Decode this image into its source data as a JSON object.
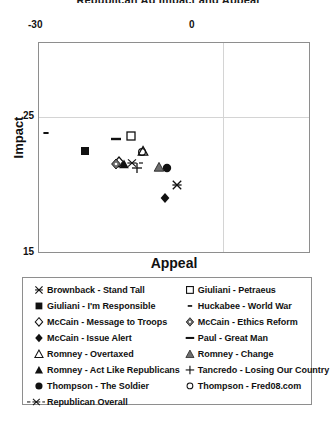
{
  "chart": {
    "title": "Republican Ad Impact and Appeal",
    "x_axis_title": "Appeal",
    "y_axis_title": "Impact"
  },
  "chart_data": {
    "type": "scatter",
    "title": "Republican Ad Impact and Appeal",
    "xlabel": "Appeal",
    "ylabel": "Impact",
    "xlim": [
      -30,
      14
    ],
    "ylim": [
      15,
      30.5
    ],
    "xticks": [
      "-30",
      "0"
    ],
    "xtick_values": [
      -30,
      0
    ],
    "yticks": [
      "25",
      "15"
    ],
    "ytick_values": [
      25,
      15
    ],
    "grid": true,
    "grid_lines": {
      "vertical_at": [
        0
      ],
      "horizontal_at": [
        25
      ]
    },
    "legend_position": "below-plot",
    "points": [
      {
        "label": "Brownback - Stand Tall",
        "marker": "x-thin",
        "x": -7.5,
        "y": 20.0
      },
      {
        "label": "Giuliani - I'm Responsible",
        "marker": "filled-square",
        "x": -22.5,
        "y": 22.5
      },
      {
        "label": "McCain - Message to Troops",
        "marker": "open-diamond",
        "x": -17.0,
        "y": 21.7
      },
      {
        "label": "McCain - Issue Alert",
        "marker": "filled-diamond",
        "x": -9.5,
        "y": 19.0
      },
      {
        "label": "Romney - Overtaxed",
        "marker": "open-triangle",
        "x": -13.0,
        "y": 22.5
      },
      {
        "label": "Romney - Act Like Republicans",
        "marker": "filled-triangle",
        "x": -16.2,
        "y": 21.5
      },
      {
        "label": "Thompson - The Soldier",
        "marker": "filled-circle",
        "x": -9.2,
        "y": 21.2
      },
      {
        "label": "Republican Overall",
        "marker": "dash-x-dash",
        "x": -14.8,
        "y": 21.6
      },
      {
        "label": "Giuliani - Petraeus",
        "marker": "open-square",
        "x": -15.0,
        "y": 23.6
      },
      {
        "label": "Huckabee - World War",
        "marker": "small-dash",
        "x": -28.8,
        "y": 23.8
      },
      {
        "label": "McCain - Ethics Reform",
        "marker": "diamond-dot",
        "x": -17.5,
        "y": 21.5
      },
      {
        "label": "Paul - Great Man",
        "marker": "thick-dash",
        "x": -17.5,
        "y": 23.4
      },
      {
        "label": "Romney - Change",
        "marker": "grey-triangle",
        "x": -10.5,
        "y": 21.3
      },
      {
        "label": "Tancredo - Losing Our Country",
        "marker": "plus",
        "x": -14.0,
        "y": 21.2
      },
      {
        "label": "Thompson - Fred08.com",
        "marker": "open-circle",
        "x": -13.2,
        "y": 22.4
      }
    ]
  },
  "legend": {
    "left_column": [
      {
        "label": "Brownback - Stand Tall",
        "marker": "x-thin"
      },
      {
        "label": "Giuliani - I'm Responsible",
        "marker": "filled-square"
      },
      {
        "label": "McCain - Message to Troops",
        "marker": "open-diamond"
      },
      {
        "label": "McCain - Issue Alert",
        "marker": "filled-diamond"
      },
      {
        "label": "Romney - Overtaxed",
        "marker": "open-triangle"
      },
      {
        "label": "Romney - Act Like Republicans",
        "marker": "filled-triangle"
      },
      {
        "label": "Thompson - The Soldier",
        "marker": "filled-circle"
      }
    ],
    "right_column": [
      {
        "label": "Giuliani - Petraeus",
        "marker": "open-square"
      },
      {
        "label": "Huckabee - World War",
        "marker": "small-dash"
      },
      {
        "label": "McCain - Ethics Reform",
        "marker": "diamond-dot"
      },
      {
        "label": "Paul - Great Man",
        "marker": "thick-dash"
      },
      {
        "label": "Romney - Change",
        "marker": "grey-triangle"
      },
      {
        "label": "Tancredo - Losing Our Country",
        "marker": "plus"
      },
      {
        "label": "Thompson - Fred08.com",
        "marker": "open-circle"
      }
    ],
    "full_width_row": {
      "label": "Republican Overall",
      "marker": "dash-x-dash"
    }
  },
  "colors": {
    "foreground": "#111111",
    "frame": "#8e8e8e",
    "gridline": "#d4d4d4",
    "grey_marker": "#6e6e6e",
    "background": "#ffffff"
  }
}
